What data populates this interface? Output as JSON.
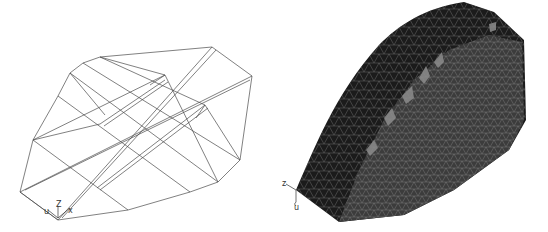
{
  "figure": {
    "left_panel": {
      "description": "wireframe-block-geometry",
      "axes": {
        "u": "u",
        "z": "Z",
        "x": "x"
      }
    },
    "right_panel": {
      "description": "tetrahedral-surface-mesh",
      "axes": {
        "z": "z",
        "u": "u"
      }
    }
  },
  "colors": {
    "background": "#ffffff",
    "wire": "#444444",
    "mesh_dark": "#1a1a1a",
    "mesh_mid": "#3a3a3a",
    "mesh_lines": "#9a9a9a"
  }
}
